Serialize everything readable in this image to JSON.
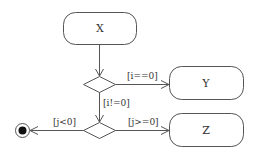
{
  "diagram": {
    "type": "uml-activity",
    "colors": {
      "stroke": "#555555",
      "text": "#333333",
      "final_fill": "#111111",
      "background": "#ffffff"
    },
    "actions": {
      "x": {
        "label": "X",
        "x": 63,
        "y": 12,
        "w": 73,
        "h": 32,
        "r": 12
      },
      "y": {
        "label": "Y",
        "x": 169,
        "y": 66,
        "w": 74,
        "h": 33,
        "r": 12
      },
      "z": {
        "label": "Z",
        "x": 169,
        "y": 113,
        "w": 74,
        "h": 33,
        "r": 12
      }
    },
    "decisions": {
      "d1": {
        "cx": 99,
        "cy": 84,
        "hw": 16,
        "hh": 8
      },
      "d2": {
        "cx": 99,
        "cy": 130,
        "hw": 16,
        "hh": 8
      }
    },
    "final_node": {
      "cx": 22,
      "cy": 130,
      "r_outer": 7,
      "r_inner": 4
    },
    "guards": {
      "i_eq_0": "[i==0]",
      "i_ne_0": "[i!=0]",
      "j_lt_0": "[j<0]",
      "j_ge_0": "[j>=0]"
    },
    "edges": [
      {
        "from": "X",
        "to": "decision-1",
        "guard": ""
      },
      {
        "from": "decision-1",
        "to": "Y",
        "guard": "[i==0]"
      },
      {
        "from": "decision-1",
        "to": "decision-2",
        "guard": "[i!=0]"
      },
      {
        "from": "decision-2",
        "to": "final",
        "guard": "[j<0]"
      },
      {
        "from": "decision-2",
        "to": "Z",
        "guard": "[j>=0]"
      }
    ]
  }
}
